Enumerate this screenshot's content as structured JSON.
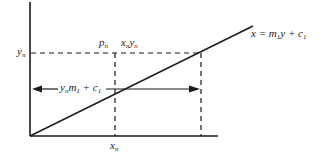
{
  "diagram": {
    "type": "line-graph-construction",
    "colors": {
      "ink": "#1a1a1a",
      "background": "#ffffff"
    },
    "axes": {
      "y_axis": {
        "x": 30,
        "y_top": 2,
        "y_bottom": 136
      },
      "x_axis": {
        "y": 136,
        "x_left": 30,
        "x_right": 218
      }
    },
    "line": {
      "equation": "x = m1 y + c1",
      "from": [
        30,
        136
      ],
      "to": [
        253,
        26
      ]
    },
    "labels": {
      "y_n": {
        "base": "y",
        "sub": "n"
      },
      "p_n": {
        "base": "p",
        "sub": "n"
      },
      "xn_yn": {
        "a": "x",
        "a_sub": "n",
        "b": "y",
        "b_sub": "n"
      },
      "x_n": {
        "base": "x",
        "sub": "n"
      },
      "line_eq": {
        "lhs": "x = m",
        "m_sub": "1",
        "mid": "y + c",
        "c_sub": "1"
      },
      "arrow_expr": {
        "y": "y",
        "y_sub": "n",
        "m": "m",
        "m_sub": "1",
        "plus": " + c",
        "c_sub": "1"
      }
    },
    "dashed_lines": [
      {
        "name": "yn-horizontal",
        "x1": 30,
        "y1": 53,
        "x2": 201,
        "y2": 53
      },
      {
        "name": "xn-vertical",
        "x1": 115,
        "y1": 53,
        "x2": 115,
        "y2": 136
      },
      {
        "name": "right-vertical",
        "x1": 201,
        "y1": 53,
        "x2": 201,
        "y2": 136
      }
    ],
    "arrow": {
      "y": 89,
      "x_left": 32,
      "x_right": 200,
      "label_gap": [
        58,
        106
      ]
    }
  }
}
